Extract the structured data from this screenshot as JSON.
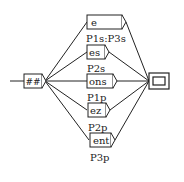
{
  "graph": {
    "initial_node": {
      "label": "##"
    },
    "final_node": {
      "label": ""
    },
    "branches": [
      {
        "box": "e",
        "output": "P1s:P3s"
      },
      {
        "box": "es",
        "output": "P2s"
      },
      {
        "box": "ons",
        "output": "P1p"
      },
      {
        "box": "ez",
        "output": "P2p"
      },
      {
        "box": "ent",
        "output": "P3p"
      }
    ]
  },
  "colors": {
    "stroke": "#222222",
    "background": "#ffffff"
  }
}
